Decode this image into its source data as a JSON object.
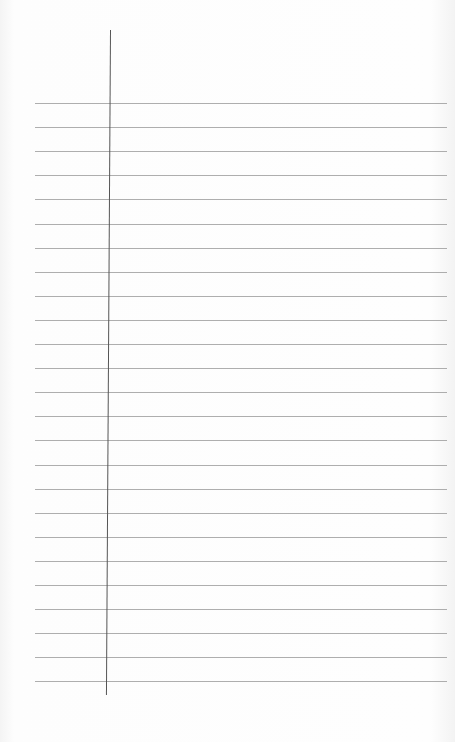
{
  "paper": {
    "type": "ruled notebook page",
    "background_color": "#fdfdfd",
    "rule_color": "#9a9a9a",
    "margin_line_color": "#555555",
    "rule_count": 25,
    "rule_first_y": 103,
    "rule_spacing": 24.1,
    "rule_left_x": 35,
    "rule_right_x": 447,
    "margin_x": 110,
    "margin_top_y": 30,
    "margin_bottom_y": 695,
    "text": ""
  }
}
